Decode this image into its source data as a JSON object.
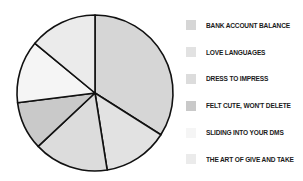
{
  "chart_data": {
    "type": "pie",
    "title": "",
    "start_angle_deg": 0,
    "direction": "clockwise",
    "categories": [
      "BANK ACCOUNT BALANCE",
      "LOVE LANGUAGES",
      "DRESS TO IMPRESS",
      "FELT CUTE, WON'T DELETE",
      "SLIDING INTO YOUR DMS",
      "THE ART OF GIVE AND TAKE"
    ],
    "values": [
      34,
      13.5,
      15.5,
      10,
      13,
      14
    ],
    "colors": [
      "#d6d6d6",
      "#e2e2e2",
      "#dcdcdc",
      "#c9c9c9",
      "#f5f5f5",
      "#ebebeb"
    ],
    "legend_position": "right",
    "stroke_color": "#111111"
  },
  "legend": {
    "items": [
      {
        "label": "BANK ACCOUNT BALANCE",
        "color": "#d6d6d6"
      },
      {
        "label": "LOVE LANGUAGES",
        "color": "#e2e2e2"
      },
      {
        "label": "DRESS TO IMPRESS",
        "color": "#dcdcdc"
      },
      {
        "label": "FELT CUTE, WON'T DELETE",
        "color": "#c9c9c9"
      },
      {
        "label": "SLIDING INTO YOUR DMS",
        "color": "#f5f5f5"
      },
      {
        "label": "THE ART OF GIVE AND TAKE",
        "color": "#ebebeb"
      }
    ]
  }
}
